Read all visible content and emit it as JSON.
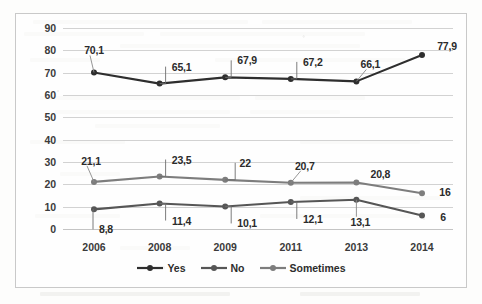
{
  "chart_data": {
    "type": "line",
    "title": "",
    "xlabel": "",
    "ylabel": "",
    "categories": [
      "2006",
      "2008",
      "2009",
      "2011",
      "2013",
      "2014"
    ],
    "ylim": [
      0,
      90
    ],
    "ytick_step": 10,
    "yticks": [
      "90",
      "80",
      "70",
      "60",
      "50",
      "40",
      "30",
      "20",
      "10",
      "0"
    ],
    "grid": true,
    "legend_position": "bottom",
    "series": [
      {
        "name": "Yes",
        "color": "#2e2e2e",
        "values": [
          70.1,
          65.1,
          67.9,
          67.2,
          66.1,
          77.9
        ],
        "labels": [
          "70,1",
          "65,1",
          "67,9",
          "67,2",
          "66,1",
          "77,9"
        ]
      },
      {
        "name": "No",
        "color": "#565656",
        "values": [
          8.8,
          11.4,
          10.1,
          12.1,
          13.1,
          6
        ],
        "labels": [
          "8,8",
          "11,4",
          "10,1",
          "12,1",
          "13,1",
          "6"
        ]
      },
      {
        "name": "Sometimes",
        "color": "#7d7d7d",
        "values": [
          21.1,
          23.5,
          22,
          20.7,
          20.8,
          16
        ],
        "labels": [
          "21,1",
          "23,5",
          "22",
          "20,7",
          "20,8",
          "16"
        ]
      }
    ]
  },
  "legend": {
    "items": [
      {
        "label": "Yes",
        "color": "#2e2e2e"
      },
      {
        "label": "No",
        "color": "#565656"
      },
      {
        "label": "Sometimes",
        "color": "#7d7d7d"
      }
    ]
  }
}
